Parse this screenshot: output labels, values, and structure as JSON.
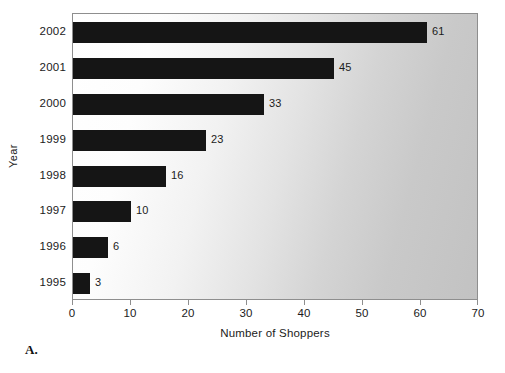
{
  "figure": {
    "label": "A."
  },
  "chart_data": {
    "type": "bar",
    "orientation": "horizontal",
    "title": "",
    "subtitle": "",
    "xlabel": "Number of Shoppers",
    "ylabel": "Year",
    "categories": [
      "2002",
      "2001",
      "2000",
      "1999",
      "1998",
      "1997",
      "1996",
      "1995"
    ],
    "values": [
      61,
      45,
      33,
      23,
      16,
      10,
      6,
      3
    ],
    "data_labels": [
      "61",
      "45",
      "33",
      "23",
      "16",
      "10",
      "6",
      "3"
    ],
    "xlim": [
      0,
      70
    ],
    "xticks": [
      0,
      10,
      20,
      30,
      40,
      50,
      60,
      70
    ],
    "xtick_labels": [
      "0",
      "10",
      "20",
      "30",
      "40",
      "50",
      "60",
      "70"
    ],
    "ytick_labels": [
      "2002",
      "2001",
      "2000",
      "1999",
      "1998",
      "1997",
      "1996",
      "1995"
    ],
    "grid": false,
    "legend": false,
    "bar_color": "#151515",
    "plot_background_from": "#ffffff",
    "plot_background_to": "#c2c2c2",
    "axis_color": "#8e8e8e"
  }
}
